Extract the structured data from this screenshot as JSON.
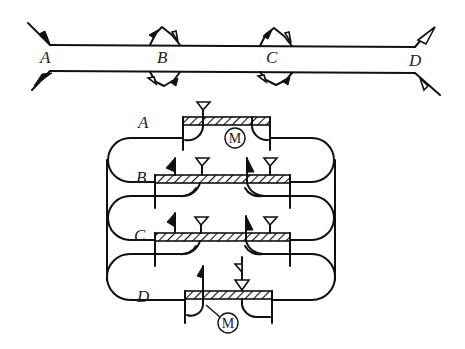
{
  "diagram": {
    "colors": {
      "stroke": "#111111",
      "background": "#ffffff"
    },
    "top_section": {
      "description": "Two parallel lines with station markers",
      "stations": [
        {
          "id": "A",
          "label": "A",
          "marker": "solid-flag-outward-both-sides"
        },
        {
          "id": "B",
          "label": "B",
          "marker": "double-flag-bumps-both-sides"
        },
        {
          "id": "C",
          "label": "C",
          "marker": "double-flag-bumps-both-sides"
        },
        {
          "id": "D",
          "label": "D",
          "marker": "open-flag-outward-both-sides"
        }
      ]
    },
    "bottom_section": {
      "description": "Stacked hatched bars with looping connections",
      "units": [
        {
          "id": "A",
          "label": "A",
          "motor_label": "M",
          "has_motor": true
        },
        {
          "id": "B",
          "label": "B",
          "has_motor": false
        },
        {
          "id": "C",
          "label": "C",
          "has_motor": false
        },
        {
          "id": "D",
          "label": "D",
          "motor_label": "M",
          "has_motor": true
        }
      ]
    }
  }
}
